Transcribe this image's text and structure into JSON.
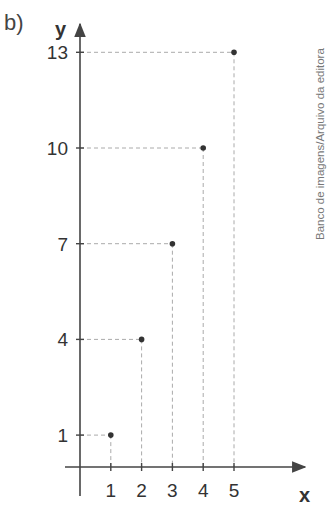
{
  "part_label": "b)",
  "credit": "Banco de imagens/Arquivo da editora",
  "chart_data": {
    "type": "scatter",
    "title": "",
    "xlabel": "x",
    "ylabel": "y",
    "x": [
      1,
      2,
      3,
      4,
      5
    ],
    "y": [
      1,
      4,
      7,
      10,
      13
    ],
    "x_ticks": [
      1,
      2,
      3,
      4,
      5
    ],
    "y_ticks": [
      1,
      4,
      7,
      10,
      13
    ],
    "projection_lines": "dashed",
    "grid": false,
    "legend": null
  },
  "colors": {
    "axis": "#444444",
    "point": "#333333",
    "dashes": "#aaaaaa",
    "text": "#333333"
  }
}
